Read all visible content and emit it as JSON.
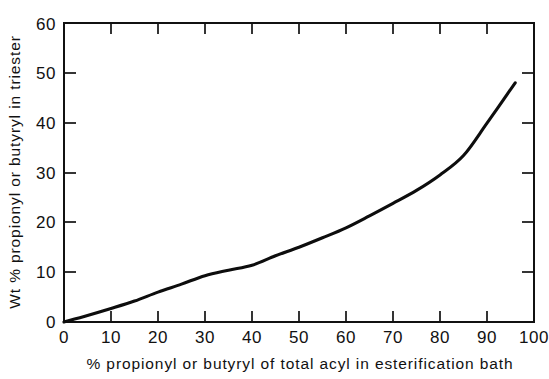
{
  "chart_data": {
    "type": "line",
    "title": "",
    "subtitle": "",
    "xlabel": "% propionyl or butyryl of total acyl in esterification bath",
    "ylabel": "Wt % propionyl or butyryl in triester",
    "xlim": [
      0,
      100
    ],
    "ylim": [
      0,
      60
    ],
    "xticks": [
      0,
      10,
      20,
      30,
      40,
      50,
      60,
      70,
      80,
      90,
      100
    ],
    "yticks": [
      0,
      10,
      20,
      30,
      40,
      50,
      60
    ],
    "xtick_labels": [
      "0",
      "10",
      "20",
      "30",
      "40",
      "50",
      "60",
      "70",
      "80",
      "90",
      "100"
    ],
    "ytick_labels": [
      "0",
      "10",
      "20",
      "30",
      "40",
      "50",
      "60"
    ],
    "grid": false,
    "legend": false,
    "legend_position": "none",
    "series": [
      {
        "name": "propionyl or butyryl incorporation",
        "color": "#0d0d0d",
        "x": [
          0,
          5,
          10,
          15,
          20,
          25,
          30,
          35,
          40,
          45,
          50,
          55,
          60,
          65,
          70,
          75,
          80,
          85,
          90,
          96
        ],
        "values": [
          0.0,
          1.3,
          2.7,
          4.2,
          6.0,
          7.6,
          9.3,
          10.4,
          11.4,
          13.3,
          15.0,
          16.9,
          18.9,
          21.3,
          23.8,
          26.4,
          29.5,
          33.4,
          39.9,
          48.0
        ]
      }
    ],
    "annotations": []
  },
  "axes": {
    "x_tick_values": [
      "0",
      "10",
      "20",
      "30",
      "40",
      "50",
      "60",
      "70",
      "80",
      "90",
      "100"
    ],
    "y_tick_values": [
      "0",
      "10",
      "20",
      "30",
      "40",
      "50",
      "60"
    ],
    "x_axis_title": "% propionyl or butyryl of total acyl in esterification bath",
    "y_axis_title": "Wt % propionyl or butyryl in triester"
  },
  "colors": {
    "background": "#ffffff",
    "axis": "#111111",
    "curve": "#0d0d0d",
    "text": "#111111"
  }
}
